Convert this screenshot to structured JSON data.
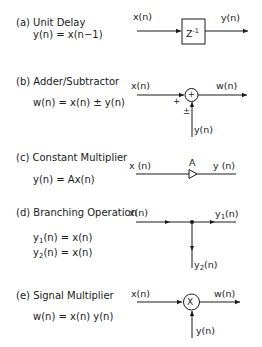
{
  "figure": {
    "panels": [
      {
        "id": "a",
        "title": "(a) Unit Delay",
        "equation": "y(n) = x(n−1)",
        "input_label": "x(n)",
        "output_label": "y(n)",
        "block_label": "Z",
        "block_exponent": "-1"
      },
      {
        "id": "b",
        "title": "(b) Adder/Subtractor",
        "equation": "w(n) = x(n) ± y(n)",
        "input_label": "x(n)",
        "output_label": "w(n)",
        "second_input_label": "y(n)",
        "node_symbol": "+",
        "sign_main": "+",
        "sign_second": "±"
      },
      {
        "id": "c",
        "title": "(c) Constant Multiplier",
        "equation": "y(n) = Ax(n)",
        "input_label": "x (n)",
        "output_label": "y (n)",
        "gain_label": "A"
      },
      {
        "id": "d",
        "title": "(d) Branching Operation",
        "equation_1_lhs": "y",
        "equation_1_sub": "1",
        "equation_1_rhs": "(n) =  x(n)",
        "equation_2_lhs": "y",
        "equation_2_sub": "2",
        "equation_2_rhs": "(n) =  x(n)",
        "input_label": "x(n)",
        "output_1_base": "y",
        "output_1_sub": "1",
        "output_1_tail": "(n)",
        "output_2_base": "y",
        "output_2_sub": "2",
        "output_2_tail": "(n)"
      },
      {
        "id": "e",
        "title": "(e) Signal Multiplier",
        "equation": "w(n) = x(n) y(n)",
        "input_label": "x(n)",
        "output_label": "w(n)",
        "second_input_label": "y(n)",
        "node_symbol": "X"
      }
    ]
  }
}
